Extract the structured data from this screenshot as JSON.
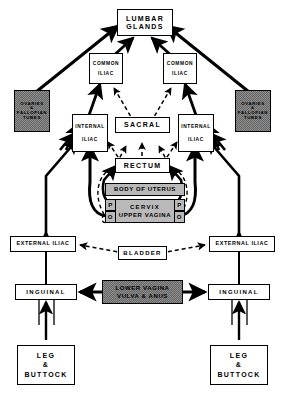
{
  "diagram": {
    "colors": {
      "line": "#000000",
      "background": "#ffffff",
      "shaded_fill": "#8f8f8f",
      "grey_fill": "#b9b9b9"
    },
    "nodes": {
      "lumbar_glands": {
        "line1": "LUMBAR",
        "line2": "GLANDS"
      },
      "common_iliac_left": {
        "line1": "COMMON",
        "line2": "ILIAC"
      },
      "common_iliac_right": {
        "line1": "COMMON",
        "line2": "ILIAC"
      },
      "ovaries_left": {
        "line1": "OVARIES",
        "line2": "&",
        "line3": "FALLOPIAN",
        "line4": "TUBES"
      },
      "ovaries_right": {
        "line1": "OVARIES",
        "line2": "&",
        "line3": "FALLOPIAN",
        "line4": "TUBES"
      },
      "internal_iliac_left": {
        "line1": "INTERNAL",
        "line2": "ILIAC"
      },
      "internal_iliac_right": {
        "line1": "INTERNAL",
        "line2": "ILIAC"
      },
      "sacral": {
        "label": "SACRAL"
      },
      "rectum": {
        "label": "RECTUM"
      },
      "body_of_uterus": {
        "label": "BODY OF UTERUS"
      },
      "cervix": {
        "line1": "CERVIX",
        "line2": "UPPER VAGINA"
      },
      "paracervical_left": {
        "label": "P"
      },
      "paracervical_right": {
        "label": "P"
      },
      "obturator_left": {
        "label": "O"
      },
      "obturator_right": {
        "label": "O"
      },
      "external_iliac_left": {
        "label": "EXTERNAL ILIAC"
      },
      "external_iliac_right": {
        "label": "EXTERNAL ILIAC"
      },
      "bladder": {
        "label": "BLADDER"
      },
      "lower_vagina": {
        "line1": "LOWER VAGINA",
        "line2": "VULVA & ANUS"
      },
      "inguinal_left": {
        "label": "INGUINAL"
      },
      "inguinal_right": {
        "label": "INGUINAL"
      },
      "leg_buttock_left": {
        "line1": "LEG",
        "line2": "&",
        "line3": "BUTTOCK"
      },
      "leg_buttock_right": {
        "line1": "LEG",
        "line2": "&",
        "line3": "BUTTOCK"
      }
    }
  }
}
